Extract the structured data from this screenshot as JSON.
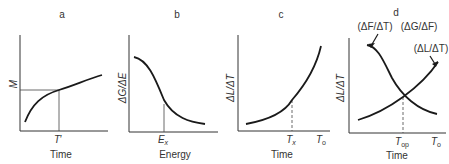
{
  "panels": [
    {
      "id": "a",
      "label": "a",
      "xlabel": "Time",
      "ylabel": "M",
      "x_marker": "T′",
      "curve": "increasing-concave",
      "guides": "solid horizontal and vertical lines from curve point at T′"
    },
    {
      "id": "b",
      "label": "b",
      "xlabel": "Energy",
      "ylabel": "ΔG/ΔE",
      "x_marker": "Eₓ",
      "curve": "decreasing-sigmoid",
      "guides": "solid vertical line at Eₓ"
    },
    {
      "id": "c",
      "label": "c",
      "xlabel": "Time",
      "ylabel": "ΔL/ΔT",
      "x_marker": "Tₓ",
      "x_end_marker": "T₀",
      "curve": "increasing-convex",
      "guides": "dashed vertical line at Tₓ"
    },
    {
      "id": "d",
      "label": "d",
      "xlabel": "Time",
      "ylabel": "ΔL/ΔT",
      "x_marker": "Tₒₚ",
      "x_end_marker": "T₀",
      "curve_labels": {
        "falling_left": "(ΔF/ΔT)",
        "falling_right": "(ΔG/ΔF)",
        "rising": "(ΔL/ΔT)"
      },
      "guides": "dashed vertical line at Tₒₚ through curve intersection"
    }
  ],
  "text": {
    "a_label": "a",
    "b_label": "b",
    "c_label": "c",
    "d_label": "d",
    "a_ylabel": "M",
    "a_xmark": "T",
    "a_xmark_prime": "′",
    "a_xlabel": "Time",
    "b_ylabel": "ΔG/ΔE",
    "b_xmark": "E",
    "b_xmark_sub": "x",
    "b_xlabel": "Energy",
    "c_ylabel": "ΔL/ΔT",
    "c_xmark": "T",
    "c_xmark_sub": "x",
    "c_xend": "T",
    "c_xend_sub": "o",
    "c_xlabel": "Time",
    "d_ylabel": "ΔL/ΔT",
    "d_curve1": "(ΔF/ΔT)",
    "d_curve2": "(ΔG/ΔF)",
    "d_curve3": "(ΔL/ΔT)",
    "d_xmark": "T",
    "d_xmark_sub": "op",
    "d_xend": "T",
    "d_xend_sub": "o",
    "d_xlabel": "Time"
  }
}
